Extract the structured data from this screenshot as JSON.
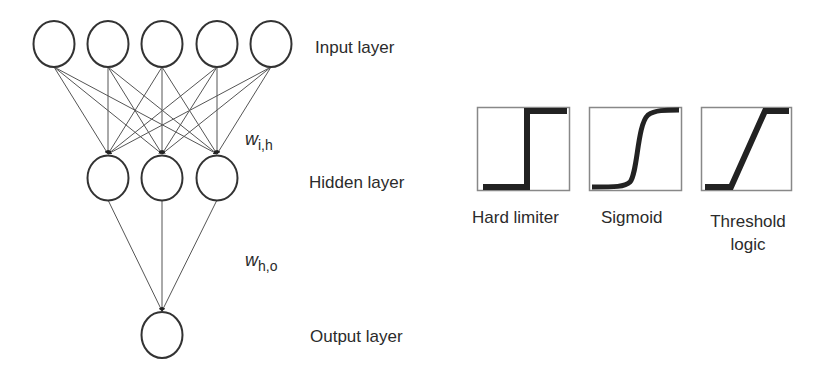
{
  "network": {
    "layers": {
      "input": {
        "label": "Input layer",
        "node_count": 5
      },
      "hidden": {
        "label": "Hidden layer",
        "node_count": 3
      },
      "output": {
        "label": "Output layer",
        "node_count": 1
      }
    },
    "weights": {
      "input_hidden": {
        "symbol": "w",
        "subscript": "i,h"
      },
      "hidden_output": {
        "symbol": "w",
        "subscript": "h,o"
      }
    },
    "connectivity": "fully connected, arrows pointing downward"
  },
  "activation_functions": [
    {
      "label": "Hard limiter",
      "shape": "step"
    },
    {
      "label": "Sigmoid",
      "shape": "s-curve"
    },
    {
      "label": "Threshold",
      "label_line2": "logic",
      "shape": "ramp"
    }
  ]
}
